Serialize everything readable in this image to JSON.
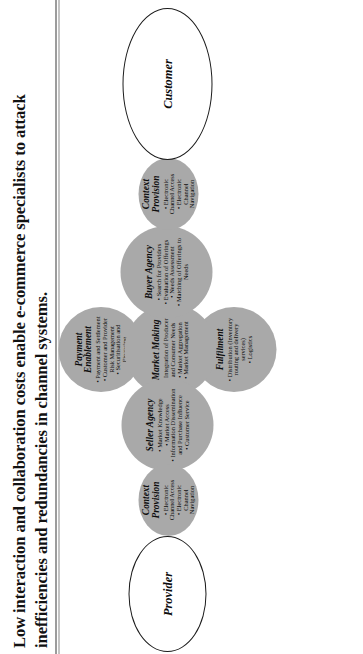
{
  "caption": {
    "text": "Low interaction and collaboration costs enable e-commerce specialists to attack inefficiencies and redundancies in channel systems."
  },
  "diagram": {
    "type": "channel-intermediary-flow",
    "orientation": "rotated-90-ccw",
    "colors": {
      "node_fill": "#a9a9a9",
      "terminal_fill": "#ffffff",
      "outline": "#1b1b1b",
      "text": "#0d0d0d"
    },
    "terminals": [
      {
        "id": "provider",
        "label": "Provider",
        "shape": "ellipse"
      },
      {
        "id": "customer",
        "label": "Customer",
        "shape": "ellipse"
      }
    ],
    "nodes": [
      {
        "id": "context-provision-left",
        "title": "Context\nProvision",
        "shape": "ellipse",
        "items": [
          "Electronic\nChannel Access",
          "Electronic\nChannel\nNavigation"
        ]
      },
      {
        "id": "seller-agency",
        "title": "Seller Agency",
        "shape": "circle",
        "items": [
          "Market Knowledge",
          "Market Access",
          "Information Dissemination\nand Purchase Influence",
          "Customer Service"
        ]
      },
      {
        "id": "payment-enablement",
        "title": "Payment\nEnablement",
        "shape": "circle",
        "items": [
          "Payment and Settlement",
          "Customer and Provider\nRisk Management",
          "Securitisation and\nFinancing"
        ]
      },
      {
        "id": "market-making",
        "title": "Market Making",
        "shape": "circle",
        "items": [
          "Integration of Producer\nand Consumer Needs",
          "Market Aggregation",
          "Market Management"
        ]
      },
      {
        "id": "fulfilment",
        "title": "Fulfilment",
        "shape": "circle",
        "items": [
          "Distribution (Inventory\nrouting and delivery\nservices)",
          "Logistics"
        ]
      },
      {
        "id": "buyer-agency",
        "title": "Buyer Agency",
        "shape": "circle",
        "items": [
          "Search for Providers",
          "Evaluation of Offerings",
          "Needs Assessment",
          "Matching of Offerings to\nNeeds"
        ]
      },
      {
        "id": "context-provision-right",
        "title": "Context\nProvision",
        "shape": "ellipse",
        "items": [
          "Electronic\nChannel Access",
          "Electronic\nChannel\nNavigation"
        ]
      }
    ]
  }
}
